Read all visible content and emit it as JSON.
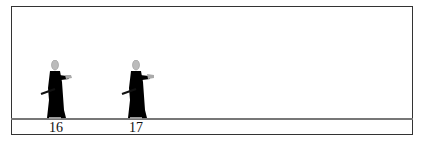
{
  "diagram": {
    "colors": {
      "border": "#333333",
      "ground": "#777777",
      "robe": "#000000",
      "head": "#bbbbbb",
      "hands": "#aaaaaa"
    },
    "figures": [
      {
        "number": "16",
        "pose": "sword-at-hip, hands forward"
      },
      {
        "number": "17",
        "pose": "sword-at-hip, right hand extended"
      }
    ]
  }
}
